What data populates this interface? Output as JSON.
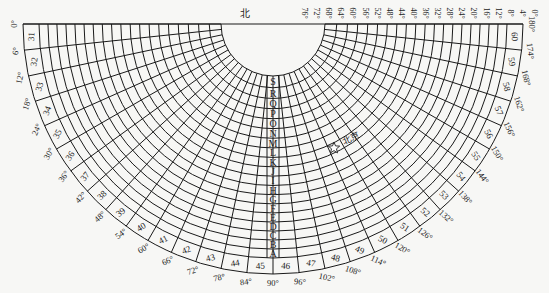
{
  "diagram": {
    "north_label": "北",
    "city_label": "北京",
    "city_marker": "star-icon",
    "ring_letters": [
      "A",
      "B",
      "C",
      "D",
      "E",
      "F",
      "G",
      "H",
      "I",
      "J",
      "K",
      "L",
      "M",
      "N",
      "O",
      "P",
      "Q",
      "R",
      "S"
    ],
    "outer_band_numbers": [
      31,
      32,
      33,
      34,
      35,
      36,
      37,
      38,
      39,
      40,
      41,
      42,
      43,
      44,
      45,
      46,
      47,
      48,
      49,
      50,
      51,
      52,
      53,
      54,
      55,
      56,
      57,
      58,
      59,
      60
    ],
    "outer_degree_labels": [
      "0°",
      "6°",
      "12°",
      "18°",
      "24°",
      "30°",
      "36°",
      "42°",
      "48°",
      "54°",
      "60°",
      "66°",
      "72°",
      "78°",
      "84°",
      "90°",
      "96°",
      "102°",
      "108°",
      "114°",
      "120°",
      "126°",
      "132°",
      "138°",
      "144°",
      "150°",
      "156°",
      "162°",
      "168°",
      "174°",
      "180°"
    ],
    "top_labels": [
      "76°",
      "72°",
      "68°",
      "64°",
      "60°",
      "56°",
      "52°",
      "48°",
      "44°",
      "40°",
      "36°",
      "32°",
      "28°",
      "24°",
      "20°",
      "16°",
      "12°",
      "8°",
      "4°",
      "0°"
    ],
    "colors": {
      "line": "#1a1a1a",
      "background": "#f7f7f5",
      "text": "#222222"
    }
  }
}
